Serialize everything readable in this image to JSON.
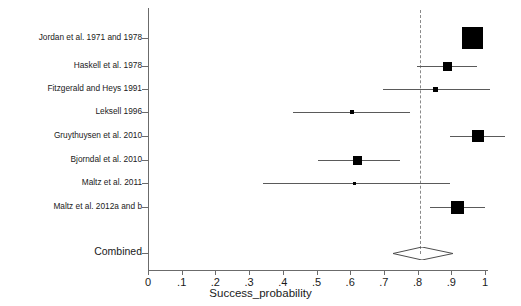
{
  "chart_data": {
    "type": "forest",
    "title": "",
    "xlabel": "Success_probability",
    "ylabel": "",
    "xlim": [
      0,
      1
    ],
    "xticks": [
      0,
      0.1,
      0.2,
      0.3,
      0.4,
      0.5,
      0.6,
      0.7,
      0.8,
      0.9,
      1
    ],
    "xticklabels": [
      "0",
      ".1",
      ".2",
      ".3",
      ".4",
      ".5",
      ".6",
      ".7",
      ".8",
      ".9",
      "1"
    ],
    "grid": false,
    "legend": "none",
    "reference_line": {
      "value": 0.807,
      "style": "dashed",
      "color": "#8a8a8a"
    },
    "studies": [
      {
        "label": "Jordan et al. 1971 and 1978",
        "estimate": 0.962,
        "ci_low": 0.932,
        "ci_high": 0.992,
        "weight_box_px": 21
      },
      {
        "label": "Haskell et al. 1978",
        "estimate": 0.89,
        "ci_low": 0.799,
        "ci_high": 0.976,
        "weight_box_px": 9
      },
      {
        "label": "Fitzgerald and Heys 1991",
        "estimate": 0.852,
        "ci_low": 0.698,
        "ci_high": 1.015,
        "weight_box_px": 5
      },
      {
        "label": "Leksell 1996",
        "estimate": 0.606,
        "ci_low": 0.431,
        "ci_high": 0.778,
        "weight_box_px": 4
      },
      {
        "label": "Gruythuysen et al. 2010",
        "estimate": 0.98,
        "ci_low": 0.896,
        "ci_high": 1.059,
        "weight_box_px": 12
      },
      {
        "label": "Bjorndal et al. 2010",
        "estimate": 0.623,
        "ci_low": 0.504,
        "ci_high": 0.748,
        "weight_box_px": 9
      },
      {
        "label": "Maltz et al. 2011",
        "estimate": 0.614,
        "ci_low": 0.341,
        "ci_high": 0.896,
        "weight_box_px": 3
      },
      {
        "label": "Maltz et al. 2012a and b",
        "estimate": 0.917,
        "ci_low": 0.836,
        "ci_high": 1.0,
        "weight_box_px": 13
      }
    ],
    "combined": {
      "label": "Combined",
      "estimate": 0.813,
      "ci_low": 0.727,
      "ci_high": 0.905
    }
  }
}
